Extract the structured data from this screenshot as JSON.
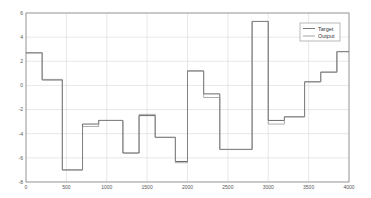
{
  "chart_data": {
    "type": "line",
    "subtype": "step",
    "title": "",
    "xlabel": "",
    "ylabel": "",
    "xlim": [
      0,
      4000
    ],
    "ylim": [
      -8,
      6
    ],
    "xticks": [
      0,
      500,
      1000,
      1500,
      2000,
      2500,
      3000,
      3500,
      4000
    ],
    "yticks": [
      6,
      4,
      2,
      0,
      -2,
      -4,
      -6,
      -8
    ],
    "grid": true,
    "legend_position": "upper right",
    "colors": {
      "target": "#5a5a5a",
      "output": "#8c8c8c",
      "grid": "#d9d9d9",
      "axis": "#7a7a7a"
    },
    "series": [
      {
        "name": "Target",
        "x": [
          0,
          200,
          450,
          700,
          900,
          1200,
          1400,
          1600,
          1850,
          2000,
          2200,
          2400,
          2800,
          3000,
          3200,
          3450,
          3650,
          3850,
          4000
        ],
        "y": [
          2.7,
          0.45,
          -7.0,
          -3.2,
          -2.9,
          -5.6,
          -2.5,
          -4.3,
          -6.3,
          1.2,
          -0.7,
          -5.3,
          5.3,
          -2.9,
          -2.6,
          0.3,
          1.1,
          2.8,
          2.8
        ]
      },
      {
        "name": "Output",
        "x": [
          0,
          200,
          450,
          700,
          900,
          1200,
          1400,
          1600,
          1850,
          2000,
          2200,
          2400,
          2800,
          3000,
          3200,
          3450,
          3650,
          3850,
          4000
        ],
        "y": [
          2.7,
          0.5,
          -7.0,
          -3.4,
          -2.9,
          -5.6,
          -2.4,
          -4.3,
          -6.4,
          1.2,
          -1.0,
          -5.3,
          5.3,
          -3.2,
          -2.6,
          0.3,
          1.1,
          2.8,
          2.8
        ]
      }
    ]
  },
  "legend": {
    "items": [
      {
        "label": "Target"
      },
      {
        "label": "Output"
      }
    ]
  }
}
